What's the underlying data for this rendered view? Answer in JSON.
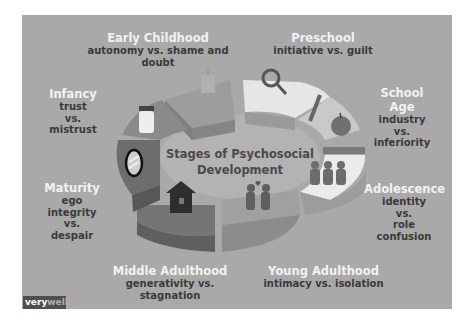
{
  "diagram": {
    "center_title_line1": "Stages of Psychosocial",
    "center_title_line2": "Development",
    "stages": [
      {
        "name": "Infancy",
        "conflict_line1": "trust",
        "conflict_line2": "vs.",
        "conflict_line3": "mistrust",
        "icon": "bottle-icon"
      },
      {
        "name": "Early Childhood",
        "conflict_line1": "autonomy vs. shame and doubt",
        "icon": "potty-icon"
      },
      {
        "name": "Preschool",
        "conflict_line1": "initiative vs. guilt",
        "icon": "magnifying-glass-icon"
      },
      {
        "name": "School Age",
        "conflict_line1": "industry",
        "conflict_line2": "vs.",
        "conflict_line3": "inferiority",
        "icon": "pencil-apple-icon"
      },
      {
        "name": "Adolescence",
        "conflict_line1": "identity",
        "conflict_line2": "vs.",
        "conflict_line3": "role confusion",
        "icon": "group-people-icon"
      },
      {
        "name": "Young Adulthood",
        "conflict_line1": "intimacy vs. isolation",
        "icon": "couple-heart-icon"
      },
      {
        "name": "Middle Adulthood",
        "conflict_line1": "generativity vs. stagnation",
        "icon": "house-icon"
      },
      {
        "name": "Maturity",
        "conflict_line1": "ego integrity",
        "conflict_line2": "vs.",
        "conflict_line3": "despair",
        "icon": "mirror-icon"
      }
    ]
  },
  "brand": {
    "part1": "very",
    "part2": "well"
  },
  "colors": {
    "panel_background": "#a9a9a9",
    "title_text": "#f2f2f2",
    "body_text": "#3a3a3a",
    "brand_background": "#4f4f4f"
  }
}
